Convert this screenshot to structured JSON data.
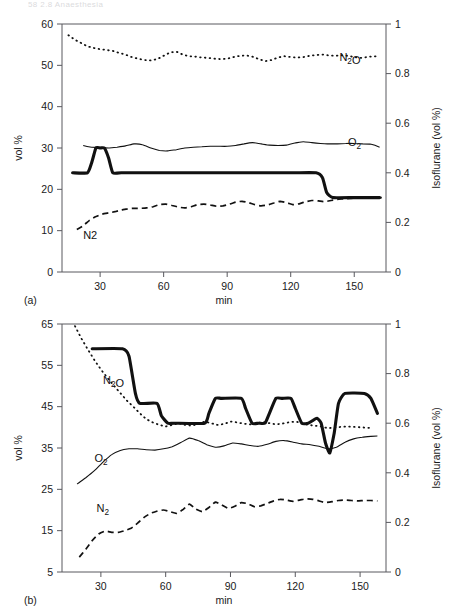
{
  "scan_header": {
    "text": "58   2.8   Anaesthesia"
  },
  "figure_labels": {
    "panel_a": "(a)",
    "panel_b": "(b)"
  },
  "chart_data": [
    {
      "id": "chart-a",
      "type": "line",
      "panel": "(a)",
      "title": "",
      "xlabel": "min",
      "ylabel": "vol %",
      "y2label": "Isoflurane (vol %)",
      "xlim": [
        12,
        165
      ],
      "ylim": [
        0,
        60
      ],
      "y2lim": [
        0,
        1
      ],
      "xticks": [
        30,
        60,
        90,
        120,
        150
      ],
      "yticks": [
        0,
        10,
        20,
        30,
        40,
        50,
        60
      ],
      "y2ticks": [
        0,
        0.2,
        0.4,
        0.6,
        0.8,
        1
      ],
      "grid": false,
      "legend_position": "inline-annotations",
      "annotations": [
        {
          "text": "N₂O",
          "x": 143,
          "y": 51.0,
          "style": "subscript"
        },
        {
          "text": "O₂",
          "x": 147,
          "y": 30.5,
          "style": "subscript"
        },
        {
          "text": "N2",
          "x": 22,
          "y": 8.0,
          "style": "plain"
        }
      ],
      "series": [
        {
          "name": "N2O",
          "label": "N₂O",
          "axis": "left",
          "style": "dotted",
          "x": [
            15,
            18,
            21,
            24,
            27,
            30,
            33,
            36,
            39,
            42,
            45,
            48,
            51,
            54,
            57,
            60,
            63,
            66,
            69,
            72,
            75,
            78,
            81,
            84,
            87,
            90,
            93,
            96,
            99,
            102,
            105,
            108,
            111,
            114,
            117,
            120,
            123,
            126,
            129,
            132,
            135,
            138,
            141,
            144,
            147,
            150,
            153,
            156,
            159,
            162
          ],
          "values": [
            57.3,
            56.2,
            55.4,
            54.6,
            54.2,
            53.9,
            53.7,
            53.5,
            53.0,
            52.6,
            52.0,
            51.6,
            51.3,
            51.2,
            51.5,
            52.3,
            53.1,
            53.3,
            52.6,
            52.2,
            52.1,
            51.9,
            51.8,
            51.6,
            51.5,
            51.6,
            52.0,
            52.3,
            52.4,
            52.1,
            51.5,
            51.0,
            51.3,
            51.9,
            52.2,
            52.0,
            51.9,
            52.0,
            52.3,
            52.5,
            52.6,
            52.4,
            52.3,
            52.4,
            52.3,
            52.0,
            51.8,
            52.0,
            52.2,
            52.1
          ]
        },
        {
          "name": "O2",
          "label": "O₂",
          "axis": "left",
          "style": "solid",
          "x": [
            22,
            26,
            30,
            34,
            38,
            42,
            46,
            50,
            54,
            58,
            62,
            66,
            70,
            74,
            78,
            82,
            86,
            90,
            94,
            98,
            102,
            106,
            110,
            114,
            118,
            122,
            126,
            130,
            134,
            138,
            142,
            146,
            150,
            154,
            158,
            162
          ],
          "values": [
            30.6,
            30.2,
            30.1,
            30.0,
            30.2,
            30.5,
            31.0,
            30.8,
            30.0,
            29.4,
            29.3,
            29.6,
            30.0,
            30.2,
            30.3,
            30.4,
            30.4,
            30.4,
            30.6,
            31.0,
            31.3,
            31.0,
            30.7,
            30.6,
            30.7,
            31.2,
            31.5,
            31.3,
            31.1,
            31.0,
            31.0,
            31.1,
            31.1,
            31.0,
            30.9,
            30.2
          ]
        },
        {
          "name": "Isoflurane",
          "label": "Isoflurane",
          "axis": "right",
          "style": "thick",
          "x": [
            17,
            24,
            26,
            28,
            30,
            32,
            34,
            36,
            40,
            60,
            90,
            120,
            132,
            135,
            137,
            140,
            150,
            162
          ],
          "values": [
            0.4,
            0.4,
            0.44,
            0.5,
            0.5,
            0.5,
            0.46,
            0.4,
            0.4,
            0.4,
            0.4,
            0.4,
            0.4,
            0.38,
            0.32,
            0.3,
            0.3,
            0.3
          ]
        },
        {
          "name": "N2",
          "label": "N2",
          "axis": "left",
          "style": "dashed",
          "x": [
            19,
            22,
            25,
            28,
            31,
            34,
            37,
            40,
            43,
            46,
            49,
            52,
            55,
            58,
            61,
            64,
            67,
            70,
            73,
            76,
            79,
            82,
            85,
            88,
            91,
            94,
            97,
            100,
            103,
            106,
            109,
            112,
            115,
            118,
            121,
            124,
            127,
            130,
            133,
            136,
            139,
            142,
            145,
            148,
            151,
            154,
            157,
            160,
            163
          ],
          "values": [
            10.3,
            11.2,
            12.5,
            13.4,
            14.0,
            14.3,
            14.6,
            15.0,
            15.3,
            15.4,
            15.4,
            15.5,
            15.8,
            16.3,
            16.4,
            16.1,
            15.7,
            15.5,
            15.8,
            16.3,
            16.4,
            16.2,
            15.9,
            16.0,
            16.4,
            16.9,
            17.1,
            16.8,
            16.3,
            16.0,
            16.2,
            16.7,
            17.1,
            16.8,
            16.3,
            16.5,
            17.0,
            17.3,
            17.2,
            17.0,
            17.3,
            17.6,
            17.7,
            17.8,
            17.9,
            17.9,
            17.9,
            18.0,
            18.0
          ]
        }
      ]
    },
    {
      "id": "chart-b",
      "type": "line",
      "panel": "(b)",
      "title": "",
      "xlabel": "min",
      "ylabel": "vol %",
      "y2label": "Isoflurane (vol %)",
      "xlim": [
        12,
        162
      ],
      "ylim": [
        5,
        65
      ],
      "y2lim": [
        0,
        1
      ],
      "xticks": [
        30,
        60,
        90,
        120,
        150
      ],
      "yticks": [
        5,
        15,
        25,
        35,
        45,
        55,
        65
      ],
      "y2ticks": [
        0,
        0.2,
        0.4,
        0.6,
        0.8,
        1
      ],
      "grid": false,
      "legend_position": "inline-annotations",
      "annotations": [
        {
          "text": "N₂O",
          "x": 31,
          "y": 50.5,
          "style": "subscript"
        },
        {
          "text": "O₂",
          "x": 27,
          "y": 31.5,
          "style": "subscript"
        },
        {
          "text": "N₂",
          "x": 28,
          "y": 19.5,
          "style": "subscript"
        }
      ],
      "series": [
        {
          "name": "N2O",
          "label": "N₂O",
          "axis": "left",
          "style": "dotted",
          "x": [
            18,
            21,
            24,
            27,
            30,
            33,
            36,
            39,
            42,
            45,
            48,
            51,
            54,
            57,
            60,
            63,
            66,
            69,
            72,
            75,
            78,
            81,
            84,
            87,
            90,
            93,
            96,
            99,
            102,
            105,
            108,
            111,
            114,
            117,
            120,
            123,
            126,
            129,
            132,
            135,
            138,
            141,
            144,
            147,
            150,
            153,
            156
          ],
          "values": [
            64.5,
            61.5,
            58.8,
            56.3,
            54.0,
            52.0,
            50.1,
            48.3,
            46.5,
            45.0,
            43.4,
            42.0,
            41.2,
            40.6,
            40.2,
            40.6,
            41.0,
            40.6,
            40.4,
            40.8,
            41.4,
            41.0,
            40.6,
            40.8,
            41.4,
            41.2,
            40.9,
            40.7,
            41.0,
            41.3,
            41.0,
            40.7,
            40.9,
            41.2,
            41.4,
            41.0,
            40.6,
            40.4,
            40.2,
            39.8,
            39.9,
            40.1,
            40.2,
            40.1,
            40.0,
            39.9,
            39.8
          ]
        },
        {
          "name": "O2",
          "label": "O₂",
          "axis": "left",
          "style": "solid",
          "x": [
            19,
            23,
            27,
            31,
            35,
            39,
            43,
            47,
            51,
            55,
            59,
            63,
            67,
            71,
            75,
            79,
            83,
            87,
            91,
            95,
            99,
            103,
            107,
            111,
            115,
            119,
            123,
            127,
            131,
            135,
            139,
            143,
            147,
            151,
            155,
            158
          ],
          "values": [
            26.3,
            27.8,
            29.5,
            31.6,
            33.4,
            34.4,
            34.8,
            34.8,
            34.6,
            34.5,
            34.8,
            35.3,
            36.3,
            37.4,
            36.8,
            35.8,
            35.2,
            35.5,
            36.2,
            36.0,
            35.6,
            35.4,
            35.9,
            36.6,
            36.8,
            36.4,
            36.0,
            35.8,
            35.4,
            34.8,
            35.2,
            36.4,
            37.2,
            37.6,
            37.8,
            37.9
          ]
        },
        {
          "name": "Isoflurane",
          "label": "Isoflurane",
          "axis": "right",
          "style": "thick",
          "x": [
            26,
            40,
            43,
            46,
            48,
            56,
            58,
            61,
            64,
            78,
            80,
            83,
            86,
            95,
            97,
            100,
            103,
            106,
            108,
            111,
            114,
            118,
            120,
            123,
            126,
            128,
            130,
            132,
            134,
            136,
            138,
            140,
            143,
            152,
            155,
            158
          ],
          "values": [
            0.9,
            0.9,
            0.87,
            0.72,
            0.68,
            0.68,
            0.63,
            0.6,
            0.6,
            0.6,
            0.64,
            0.7,
            0.7,
            0.7,
            0.66,
            0.6,
            0.6,
            0.6,
            0.64,
            0.7,
            0.7,
            0.7,
            0.66,
            0.6,
            0.6,
            0.61,
            0.62,
            0.6,
            0.52,
            0.48,
            0.56,
            0.68,
            0.72,
            0.72,
            0.7,
            0.64
          ]
        },
        {
          "name": "N2",
          "label": "N₂",
          "axis": "left",
          "style": "dashed",
          "x": [
            20,
            23,
            26,
            29,
            32,
            35,
            38,
            41,
            44,
            47,
            50,
            53,
            56,
            59,
            62,
            65,
            68,
            71,
            74,
            77,
            80,
            83,
            86,
            89,
            92,
            95,
            98,
            101,
            104,
            107,
            110,
            113,
            116,
            119,
            122,
            125,
            128,
            131,
            134,
            137,
            140,
            143,
            146,
            149,
            152,
            155,
            158
          ],
          "values": [
            8.6,
            10.5,
            12.6,
            14.2,
            14.9,
            14.6,
            14.6,
            15.0,
            15.6,
            16.8,
            18.2,
            19.2,
            19.7,
            20.0,
            19.6,
            19.2,
            20.1,
            21.4,
            20.2,
            19.6,
            20.6,
            21.9,
            21.2,
            20.4,
            20.9,
            21.8,
            21.5,
            20.8,
            21.0,
            21.6,
            22.2,
            22.6,
            22.4,
            22.1,
            22.4,
            22.7,
            22.6,
            22.2,
            21.8,
            22.0,
            22.3,
            22.4,
            22.3,
            22.2,
            22.3,
            22.3,
            22.2
          ]
        }
      ]
    }
  ]
}
